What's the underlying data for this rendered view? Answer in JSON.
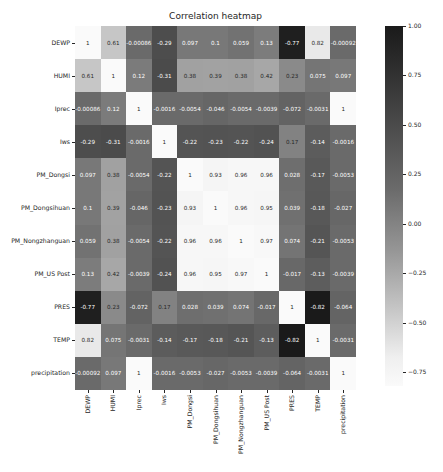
{
  "chart_data": {
    "type": "heatmap",
    "title": "Correlation heatmap",
    "xlabel": "",
    "ylabel": "",
    "labels": [
      "DEWP",
      "HUMI",
      "Iprec",
      "Iws",
      "PM_Dongsi",
      "PM_Dongsihuan",
      "PM_Nongzhanguan",
      "PM_US Post",
      "PRES",
      "TEMP",
      "precipitation"
    ],
    "matrix": [
      [
        1,
        0.61,
        -0.00086,
        -0.29,
        0.097,
        0.1,
        0.059,
        0.13,
        -0.77,
        0.82,
        -0.00092
      ],
      [
        0.61,
        1,
        0.12,
        -0.31,
        0.38,
        0.39,
        0.38,
        0.42,
        0.23,
        0.075,
        0.097
      ],
      [
        -0.00086,
        0.12,
        1,
        -0.0016,
        -0.0054,
        -0.046,
        -0.0054,
        -0.0039,
        -0.072,
        -0.0031,
        1
      ],
      [
        -0.29,
        -0.31,
        -0.0016,
        1,
        -0.22,
        -0.23,
        -0.22,
        -0.24,
        0.17,
        -0.14,
        -0.0016
      ],
      [
        0.097,
        0.38,
        -0.0054,
        -0.22,
        1,
        0.93,
        0.96,
        0.96,
        0.028,
        -0.17,
        -0.0053
      ],
      [
        0.1,
        0.39,
        -0.046,
        -0.23,
        0.93,
        1,
        0.96,
        0.95,
        0.039,
        -0.18,
        -0.027
      ],
      [
        0.059,
        0.38,
        -0.0054,
        -0.22,
        0.96,
        0.96,
        1,
        0.97,
        0.074,
        -0.21,
        -0.0053
      ],
      [
        0.13,
        0.42,
        -0.0039,
        -0.24,
        0.96,
        0.95,
        0.97,
        1,
        -0.017,
        -0.13,
        -0.0039
      ],
      [
        -0.77,
        0.23,
        -0.072,
        0.17,
        0.028,
        0.039,
        0.074,
        -0.017,
        1,
        -0.82,
        -0.064
      ],
      [
        0.82,
        0.075,
        -0.0031,
        -0.14,
        -0.17,
        -0.18,
        -0.21,
        -0.13,
        -0.82,
        1,
        -0.0031
      ],
      [
        -0.00092,
        0.097,
        1,
        -0.0016,
        -0.0053,
        -0.027,
        -0.0053,
        -0.0039,
        -0.064,
        -0.0031,
        1
      ]
    ],
    "annotations": [
      [
        "1",
        "0.61",
        "-0.00086",
        "-0.29",
        "0.097",
        "0.1",
        "0.059",
        "0.13",
        "-0.77",
        "0.82",
        "-0.00092"
      ],
      [
        "0.61",
        "1",
        "0.12",
        "-0.31",
        "0.38",
        "0.39",
        "0.38",
        "0.42",
        "0.23",
        "0.075",
        "0.097"
      ],
      [
        "-0.00086",
        "0.12",
        "1",
        "-0.0016",
        "-0.0054",
        "-0.046",
        "-0.0054",
        "-0.0039",
        "-0.072",
        "-0.0031",
        "1"
      ],
      [
        "-0.29",
        "-0.31",
        "-0.0016",
        "1",
        "-0.22",
        "-0.23",
        "-0.22",
        "-0.24",
        "0.17",
        "-0.14",
        "-0.0016"
      ],
      [
        "0.097",
        "0.38",
        "-0.0054",
        "-0.22",
        "1",
        "0.93",
        "0.96",
        "0.96",
        "0.028",
        "-0.17",
        "-0.0053"
      ],
      [
        "0.1",
        "0.39",
        "-0.046",
        "-0.23",
        "0.93",
        "1",
        "0.96",
        "0.95",
        "0.039",
        "-0.18",
        "-0.027"
      ],
      [
        "0.059",
        "0.38",
        "-0.0054",
        "-0.22",
        "0.96",
        "0.96",
        "1",
        "0.97",
        "0.074",
        "-0.21",
        "-0.0053"
      ],
      [
        "0.13",
        "0.42",
        "-0.0039",
        "-0.24",
        "0.96",
        "0.95",
        "0.97",
        "1",
        "-0.017",
        "-0.13",
        "-0.0039"
      ],
      [
        "-0.77",
        "0.23",
        "-0.072",
        "0.17",
        "0.028",
        "0.039",
        "0.074",
        "-0.017",
        "1",
        "-0.82",
        "-0.064"
      ],
      [
        "0.82",
        "0.075",
        "-0.0031",
        "-0.14",
        "-0.17",
        "-0.18",
        "-0.21",
        "-0.13",
        "-0.82",
        "1",
        "-0.0031"
      ],
      [
        "-0.00092",
        "0.097",
        "1",
        "-0.0016",
        "-0.0053",
        "-0.027",
        "-0.0053",
        "-0.0039",
        "-0.064",
        "-0.0031",
        "1"
      ]
    ],
    "colorbar": {
      "ticks": [
        "1.00",
        "0.75",
        "0.50",
        "0.25",
        "0.00",
        "−0.25",
        "−0.50",
        "−0.75"
      ],
      "tick_values": [
        1.0,
        0.75,
        0.5,
        0.25,
        0.0,
        -0.25,
        -0.5,
        -0.75
      ],
      "vmin": -0.82,
      "vmax": 1.0,
      "colormap": "greys (white = low, near-black = high)"
    },
    "grid": false,
    "legend_position": "right colorbar"
  }
}
